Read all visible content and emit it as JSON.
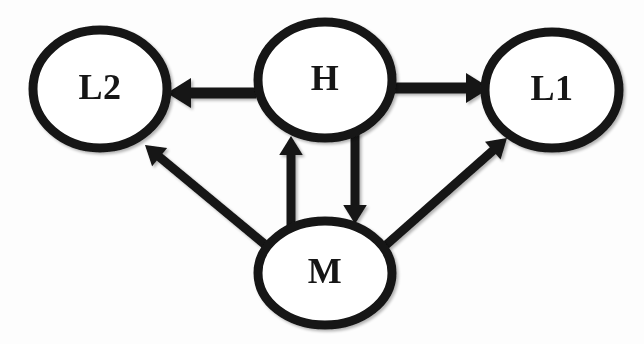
{
  "diagram": {
    "background_color": "#fdfdfd",
    "stroke_color": "#141414",
    "node_fill_color": "#ffffff",
    "nodes": [
      {
        "id": "L2",
        "label": "L2",
        "cx": 100,
        "cy": 89,
        "rx": 67,
        "ry": 59,
        "stroke_width": 9
      },
      {
        "id": "H",
        "label": "H",
        "cx": 325,
        "cy": 80,
        "rx": 67,
        "ry": 58,
        "stroke_width": 9
      },
      {
        "id": "L1",
        "label": "L1",
        "cx": 552,
        "cy": 90,
        "rx": 67,
        "ry": 58,
        "stroke_width": 9
      },
      {
        "id": "M",
        "label": "M",
        "cx": 325,
        "cy": 273,
        "rx": 67,
        "ry": 52,
        "stroke_width": 9
      }
    ],
    "edges": [
      {
        "id": "h-to-l2",
        "from": "H",
        "to": "L2",
        "direction": "left",
        "style": "thick-block-arrow",
        "shaft": {
          "x1": 256,
          "y1": 93,
          "x2": 188,
          "y2": 93,
          "width": 11
        },
        "head": {
          "tip_x": 167,
          "tip_y": 93,
          "size": 24
        }
      },
      {
        "id": "h-to-l1",
        "from": "H",
        "to": "L1",
        "direction": "right",
        "style": "thick-block-arrow",
        "shaft": {
          "x1": 394,
          "y1": 88,
          "x2": 462,
          "y2": 88,
          "width": 11
        },
        "head": {
          "tip_x": 490,
          "tip_y": 88,
          "size": 24
        }
      },
      {
        "id": "m-to-h",
        "from": "M",
        "to": "H",
        "direction": "up",
        "style": "thin-line-arrow",
        "shaft": {
          "x1": 291,
          "y1": 228,
          "x2": 291,
          "y2": 158,
          "width": 9
        },
        "head": {
          "tip_x": 291,
          "tip_y": 136,
          "size": 19
        }
      },
      {
        "id": "h-to-m",
        "from": "H",
        "to": "M",
        "direction": "down",
        "style": "thin-line-arrow",
        "shaft": {
          "x1": 355,
          "y1": 133,
          "x2": 355,
          "y2": 200,
          "width": 9
        },
        "head": {
          "tip_x": 355,
          "tip_y": 224,
          "size": 19
        }
      },
      {
        "id": "m-to-l2",
        "from": "M",
        "to": "L2",
        "direction": "up-left",
        "style": "thin-line-arrow",
        "shaft": {
          "x1": 268,
          "y1": 247,
          "x2": 163,
          "y2": 160,
          "width": 9
        },
        "head": {
          "tip_x": 145,
          "tip_y": 145,
          "size": 19
        }
      },
      {
        "id": "m-to-l1",
        "from": "M",
        "to": "L1",
        "direction": "up-right",
        "style": "thin-line-arrow",
        "shaft": {
          "x1": 386,
          "y1": 245,
          "x2": 489,
          "y2": 154,
          "width": 9
        },
        "head": {
          "tip_x": 507,
          "tip_y": 138,
          "size": 19
        }
      }
    ]
  }
}
